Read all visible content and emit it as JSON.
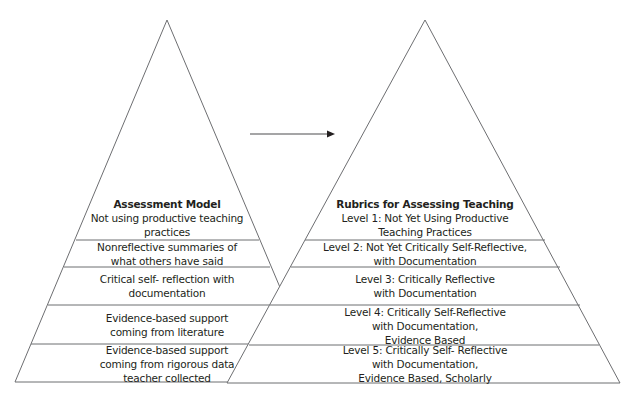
{
  "left_pyramid": {
    "title": "Assessment Model",
    "tiers": [
      {
        "lines": [
          "Not using productive teaching",
          "practices"
        ]
      },
      {
        "lines": [
          "Nonreflective summaries of",
          "what others have said"
        ]
      },
      {
        "lines": [
          "Critical self- reflection with",
          "documentation"
        ]
      },
      {
        "lines": [
          "Evidence-based support",
          "coming from literature"
        ]
      },
      {
        "lines": [
          "Evidence-based support",
          "coming from rigorous data",
          "teacher collected"
        ]
      }
    ]
  },
  "right_pyramid": {
    "title": "Rubrics for Assessing Teaching",
    "tiers": [
      {
        "lines": [
          "Level 1: Not Yet Using Productive",
          "Teaching Practices"
        ]
      },
      {
        "lines": [
          "Level 2: Not Yet Critically Self-Reflective,",
          "with Documentation"
        ]
      },
      {
        "lines": [
          "Level 3: Critically Reflective",
          "with Documentation"
        ]
      },
      {
        "lines": [
          "Level 4: Critically Self-Reflective",
          "with Documentation,",
          "Evidence Based"
        ]
      },
      {
        "lines": [
          "Level 5: Critically Self- Reflective",
          "with Documentation,",
          "Evidence Based, Scholarly"
        ]
      }
    ]
  },
  "arrow": {
    "direction": "right"
  },
  "colors": {
    "stroke": "#58595b",
    "text": "#231f20",
    "background": "#ffffff"
  }
}
